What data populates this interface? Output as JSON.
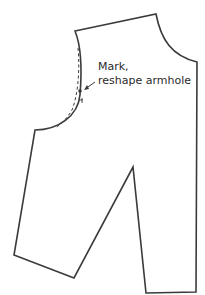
{
  "diagram": {
    "type": "sewing-pattern-piece",
    "annotation": {
      "line1": "Mark,",
      "line2": "reshape armhole"
    },
    "colors": {
      "outline": "#3a3a3a",
      "background": "#ffffff"
    }
  }
}
